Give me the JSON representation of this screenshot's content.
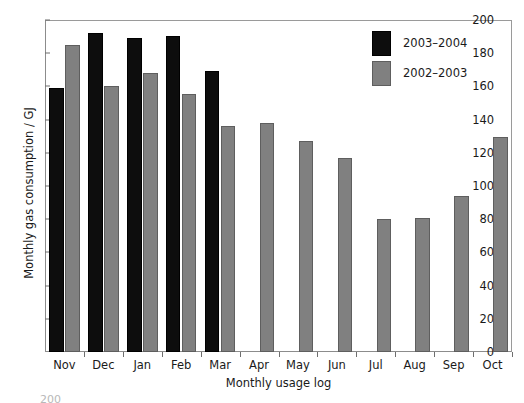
{
  "chart_data": {
    "type": "bar",
    "title": "",
    "xlabel": "Monthly usage log",
    "ylabel": "Monthly gas consumption / GJ",
    "categories": [
      "Nov",
      "Dec",
      "Jan",
      "Feb",
      "Mar",
      "Apr",
      "May",
      "Jun",
      "Jul",
      "Aug",
      "Sep",
      "Oct"
    ],
    "series": [
      {
        "name": "2003–2004",
        "color": "#0d0d0d",
        "values": [
          159,
          192,
          189,
          190.5,
          169,
          null,
          null,
          null,
          null,
          null,
          null,
          null
        ]
      },
      {
        "name": "2002–2003",
        "color": "#808080",
        "values": [
          185,
          160.5,
          168,
          155.5,
          136,
          138,
          127,
          117,
          80,
          81,
          94,
          129.5
        ]
      }
    ],
    "ylim": [
      0,
      200
    ],
    "yticks": [
      0,
      20,
      40,
      60,
      80,
      100,
      120,
      140,
      160,
      180,
      200
    ],
    "ytick_labels": [
      "0",
      "20",
      "40",
      "60",
      "80",
      "100",
      "120",
      "140",
      "160",
      "180",
      "200"
    ],
    "grid": false,
    "legend_position": "upper right",
    "legend_entries": [
      "2003–2004",
      "2002–2003"
    ]
  },
  "page": {
    "bottom_artifact": "200"
  }
}
